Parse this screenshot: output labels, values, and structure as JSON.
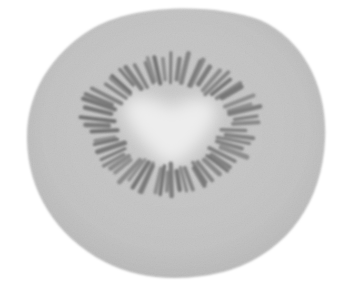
{
  "image": {
    "subject": "kiwi fruit cross-section",
    "style": "grayscale photograph",
    "colors": {
      "background": "#ffffff",
      "flesh": "#c4c4c4",
      "flesh_edge": "#b8b8b8",
      "core": "#ececec",
      "seeds": "#6e6e6e"
    },
    "seed_count": 64
  }
}
